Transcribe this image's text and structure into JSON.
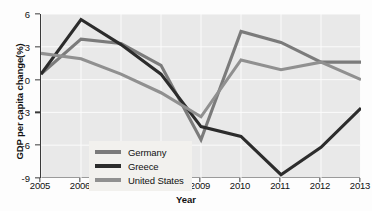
{
  "chart_data": {
    "type": "line",
    "title": "",
    "xlabel": "Year",
    "ylabel": "GDP per capita change(%)",
    "x": [
      2005,
      2006,
      2007,
      2008,
      2009,
      2010,
      2011,
      2012,
      2013
    ],
    "xticklabels": [
      "2005",
      "2006",
      "2007",
      "2008",
      "2009",
      "2010",
      "2011",
      "2012",
      "2013"
    ],
    "yticklabels": [
      "6",
      "3",
      "0",
      "-3",
      "-6",
      "-9"
    ],
    "yticks": [
      6,
      3,
      0,
      -3,
      -6,
      -9
    ],
    "ylim": [
      -9,
      6
    ],
    "xlim": [
      2005,
      2013
    ],
    "grid": true,
    "legend_position": "lower-left-inside",
    "series": [
      {
        "name": "Germany",
        "color": "#7b7b7b",
        "values": [
          0.5,
          3.7,
          3.3,
          1.3,
          -5.5,
          4.4,
          3.4,
          1.6,
          1.6
        ]
      },
      {
        "name": "Greece",
        "color": "#2c2c2c",
        "values": [
          0.5,
          5.5,
          3.2,
          0.5,
          -4.3,
          -5.2,
          -8.7,
          -6.2,
          -2.6
        ]
      },
      {
        "name": "United States",
        "color": "#909090",
        "values": [
          2.4,
          1.9,
          0.5,
          -1.2,
          -3.4,
          1.8,
          0.9,
          1.6,
          0.0
        ]
      }
    ]
  },
  "axis": {
    "y_title": "GDP per capita change(%)",
    "x_title": "Year"
  },
  "legend": {
    "items": [
      {
        "label": "Germany",
        "color": "#7b7b7b"
      },
      {
        "label": "Greece",
        "color": "#2c2c2c"
      },
      {
        "label": "United States",
        "color": "#909090"
      }
    ]
  },
  "colors": {
    "plot_background": "#e9e9e9",
    "gridline": "#fbfbfb",
    "axis": "#3a3a3a",
    "legend_background": "#f2f1ee",
    "germany": "#7b7b7b",
    "greece": "#2c2c2c",
    "united_states": "#909090"
  }
}
